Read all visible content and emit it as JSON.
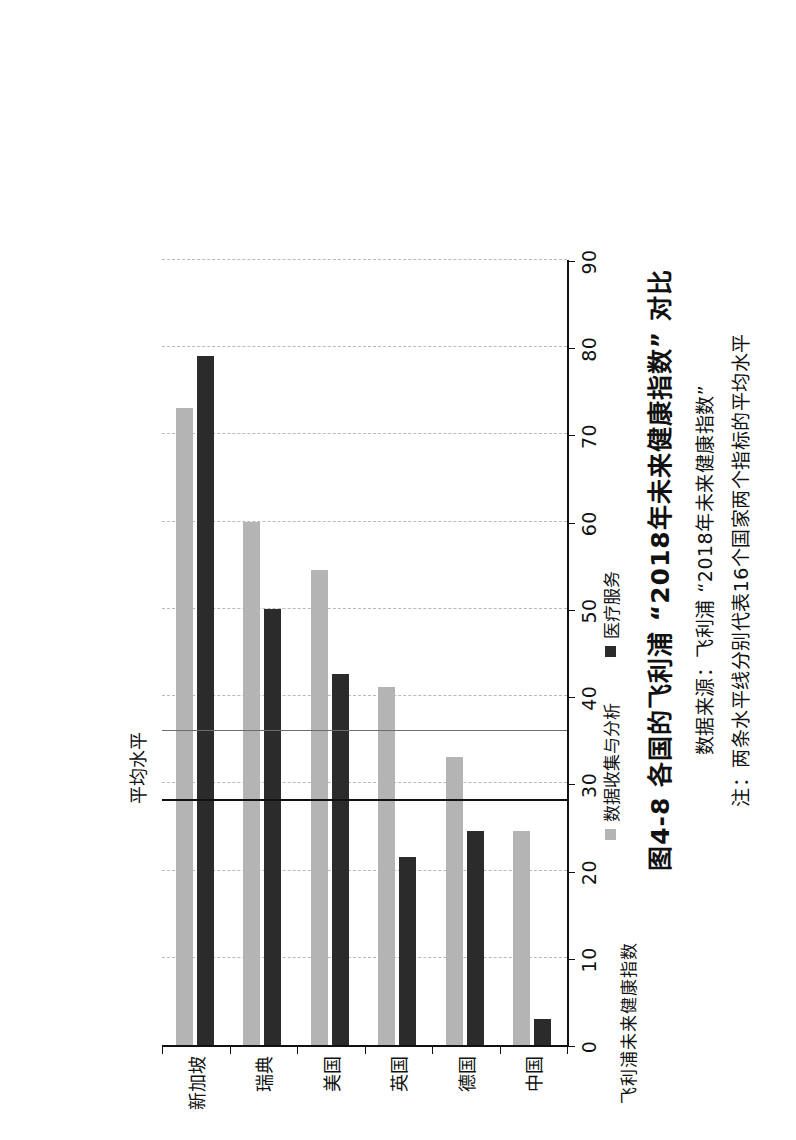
{
  "figure": {
    "title": "图4-8  各国的飞利浦 “2018年未来健康指数” 对比",
    "source": "数据来源：飞利浦 “2018年未来健康指数”",
    "note": "注：两条水平线分别代表16个国家两个指标的平均水平"
  },
  "legend": {
    "position": "bottom",
    "items": [
      {
        "label": "数据收集与分析",
        "color": "#b4b4b4",
        "icon": "square-swatch"
      },
      {
        "label": "医疗服务",
        "color": "#2b2b2b",
        "icon": "square-swatch"
      }
    ]
  },
  "annotations": {
    "average_label": "平均水平"
  },
  "chart_data": {
    "type": "bar",
    "orientation": "horizontal-rotated",
    "title": "图4-8  各国的飞利浦 “2018年未来健康指数” 对比",
    "xlabel": "国 家",
    "ylabel": "飞利浦未来健康指数",
    "ylim": [
      0,
      90
    ],
    "yticks": [
      0,
      10,
      20,
      30,
      40,
      50,
      60,
      70,
      80,
      90
    ],
    "ytick_labels": [
      "0",
      "10",
      "20",
      "30",
      "40",
      "50",
      "60",
      "70",
      "80",
      "90"
    ],
    "grid": true,
    "categories": [
      "新加坡",
      "瑞典",
      "美国",
      "英国",
      "德国",
      "中国"
    ],
    "series": [
      {
        "name": "数据收集与分析",
        "color": "#b4b4b4",
        "values": [
          73,
          60,
          54.5,
          41,
          33,
          24.5
        ]
      },
      {
        "name": "医疗服务",
        "color": "#2b2b2b",
        "values": [
          79,
          50,
          42.5,
          21.5,
          24.5,
          3
        ]
      }
    ],
    "reference_lines": [
      {
        "name": "数据收集与分析平均水平",
        "value": 36,
        "color": "#6d6d6d",
        "label": "平均水平"
      },
      {
        "name": "医疗服务平均水平",
        "value": 28,
        "color": "#111111",
        "label": "平均水平"
      }
    ]
  }
}
